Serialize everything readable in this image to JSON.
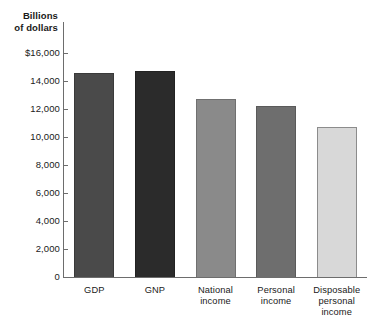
{
  "chart_data": {
    "type": "bar",
    "title": "",
    "subtitle": "",
    "xlabel": "",
    "ylabel": "Billions of dollars",
    "ylabel_lines": [
      "Billions",
      "of dollars"
    ],
    "categories": [
      "GDP",
      "GNP",
      "National income",
      "Personal income",
      "Disposable personal income"
    ],
    "category_label_lines": [
      [
        "GDP"
      ],
      [
        "GNP"
      ],
      [
        "National",
        "income"
      ],
      [
        "Personal",
        "income"
      ],
      [
        "Disposable",
        "personal",
        "income"
      ]
    ],
    "values": [
      14550,
      14700,
      12700,
      12200,
      10700
    ],
    "ylim": [
      0,
      16000
    ],
    "ytick_values": [
      16000,
      14000,
      12000,
      10000,
      8000,
      6000,
      4000,
      2000,
      0
    ],
    "ytick_labels": [
      "$16,000",
      "14,000",
      "12,000",
      "10,000",
      "8,000",
      "6,000",
      "4,000",
      "2,000",
      "0"
    ],
    "grid": false,
    "legend": false,
    "legend_position": "none",
    "bar_colors": [
      "#4a4a4a",
      "#2b2b2b",
      "#8a8a8a",
      "#6e6e6e",
      "#d8d8d8"
    ],
    "bar_border_colors": [
      "#3a3a3a",
      "#222222",
      "#707070",
      "#5a5a5a",
      "#8c8c8c"
    ],
    "axis_color": "#6d6d6d"
  }
}
